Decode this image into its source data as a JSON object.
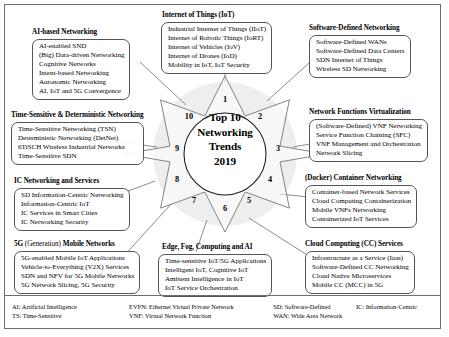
{
  "center": {
    "lines": [
      "Top 10",
      "Networking",
      "Trends",
      "2019"
    ]
  },
  "numbers": [
    "1",
    "2",
    "3",
    "4",
    "5",
    "6",
    "7",
    "8",
    "9",
    "10"
  ],
  "groups": {
    "ai": {
      "title": "AI-based Networking",
      "title_regular": "",
      "items": [
        "AI-enabled SND",
        "(Big) Data-driven Networking",
        "Cognitive Networks",
        "Intent-based Networking",
        "Autonomic Networking",
        "AI, IoT and 5G Convergence"
      ]
    },
    "iot": {
      "title": "Internet of Things (IoT)",
      "items": [
        "Industrial Internet of Things (IIoT)",
        "Internet of Robotic Things (IoRT)",
        "Internet of Vehicles (IoV)",
        "Internet of Drones (IoD)",
        "Mobility in IoT, IoT Security"
      ]
    },
    "sdn": {
      "title": "Software-Defined Networking",
      "items": [
        "Software-Defined WANs",
        "Software-Defined Data Centers",
        "SDN Internet of Things",
        "Wireless SD Networking"
      ]
    },
    "nfv": {
      "title": "Network Functions Virtualization",
      "items": [
        "(Software-Defined) VNF Networking",
        "Service Function Chaining (SFC)",
        "VNF Management and Orchestration",
        "Network Slicing"
      ]
    },
    "container": {
      "title": "(Docker) Container Networking",
      "items": [
        "Container-based Network Services",
        "Cloud Computing Containerization",
        "Mobile VNFs Networking",
        "Containerized IoT Services"
      ]
    },
    "cloud": {
      "title": "Cloud Computing (CC) Services",
      "items": [
        "Infrastructure as a Service (Iaas)",
        "Software-Defined CC Networking",
        "Cloud Native Microservices",
        "Mobile CC (MCC) in 5G"
      ]
    },
    "edge": {
      "title": "Edge, Fog, Computing and AI",
      "items": [
        "Time-sensitive IoT/5G Applications",
        "Intelligent IoT, Cognitive IoT",
        "Ambient Intelligence in IoT",
        "IoT Service Orchestration"
      ]
    },
    "fiveg": {
      "title_prefix": "5G",
      "title_regular": "(Generation)",
      "title_suffix": "Mobile Networks",
      "items": [
        "5G-enabled Mobile IoT Applications",
        "Vehicle-to-Everything (V2X) Services",
        "SDN and NFV for 5G Mobile Networks",
        "5G Network Slicing, 5G Security"
      ]
    },
    "ic": {
      "title": "IC Networking and Services",
      "items": [
        "SD Information-Centric Networking",
        "Information-Centric IoT",
        "IC Services in Smart Cities",
        "IC Networking Security"
      ]
    },
    "ts": {
      "title": "Time-Sensitive & Deterministic Networking",
      "items": [
        "Time-Sensitive Networking (TSN)",
        "Deterministic Networking (DetNet)",
        "6TiSCH Wireless Industrial Networks",
        "Time-Sensitive SDN"
      ]
    }
  },
  "legend": {
    "rows": [
      [
        "AI: Artificial Intelligence",
        "EVPN: Ethernet Virtual Private Network",
        "SD: Software-Defined",
        "IC: Information-Centric"
      ],
      [
        "TS: Time-Sensitive",
        "VNF: Virtual Network Function",
        "WAN: Wide Area  Network",
        ""
      ]
    ]
  },
  "colors": {
    "line": "#6e6e6e",
    "box_border": "#555555",
    "halo": "#eeeeee",
    "text": "#000000",
    "background": "#ffffff"
  }
}
